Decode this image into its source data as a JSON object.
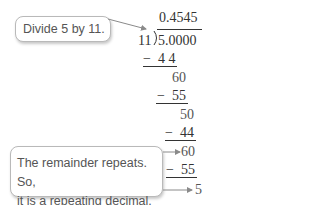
{
  "callouts": {
    "top": "Divide 5 by 11.",
    "bottom_line1": "The remainder repeats. So,",
    "bottom_line2": "it is a repeating decimal."
  },
  "division": {
    "quotient": "0.4545",
    "divisor": "11",
    "dividend": "5.0000",
    "steps": [
      {
        "minus": "−",
        "value": "4 4"
      },
      {
        "remainder": "60"
      },
      {
        "minus": "−",
        "value": "55"
      },
      {
        "remainder": "50"
      },
      {
        "minus": "−",
        "value": "44"
      },
      {
        "remainder": "60"
      },
      {
        "minus": "−",
        "value": "55"
      },
      {
        "remainder": "5"
      }
    ]
  },
  "colors": {
    "text": "#333333",
    "callout_border": "#b9b9b9",
    "arrow": "#8a8a8a"
  }
}
